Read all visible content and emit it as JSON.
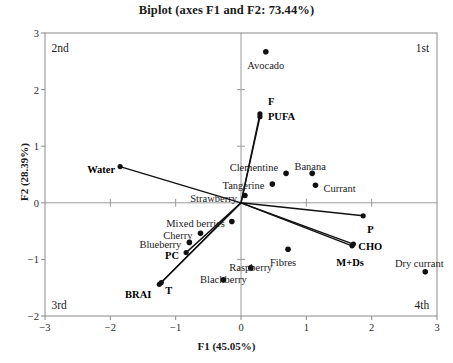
{
  "chart_data": {
    "type": "scatter",
    "title": "Biplot (axes F1 and F2: 73.44%)",
    "xlabel": "F1 (45.05%)",
    "ylabel": "F2 (28.39%)",
    "xlim": [
      -3,
      3
    ],
    "ylim": [
      -2,
      3
    ],
    "xticks": [
      "-3",
      "-2",
      "-1",
      "0",
      "1",
      "2",
      "3"
    ],
    "xtick_values": [
      -3,
      -2,
      -1,
      0,
      1,
      2,
      3
    ],
    "yticks": [
      "-2",
      "-1",
      "0",
      "1",
      "2",
      "3"
    ],
    "ytick_values": [
      -2,
      -1,
      0,
      1,
      2,
      3
    ],
    "grid": false,
    "legend": "none",
    "quadrant_labels": [
      {
        "text": "2nd",
        "x": -2.9,
        "y": 2.72,
        "anchor": "start"
      },
      {
        "text": "1st",
        "x": 2.88,
        "y": 2.72,
        "anchor": "end"
      },
      {
        "text": "3rd",
        "x": -2.9,
        "y": -1.83,
        "anchor": "start"
      },
      {
        "text": "4th",
        "x": 2.88,
        "y": -1.83,
        "anchor": "end"
      }
    ],
    "observations": [
      {
        "name": "Avocado",
        "x": 0.38,
        "y": 2.67,
        "label_dx": 0,
        "label_dy": 14,
        "anchor": "middle"
      },
      {
        "name": "Clementine",
        "x": 0.69,
        "y": 0.52,
        "label_dx": -8,
        "label_dy": -5,
        "anchor": "end"
      },
      {
        "name": "Tangerine",
        "x": 0.48,
        "y": 0.33,
        "label_dx": -8,
        "label_dy": 2,
        "anchor": "end"
      },
      {
        "name": "Strawberry",
        "x": 0.06,
        "y": 0.13,
        "label_dx": -8,
        "label_dy": 4,
        "anchor": "end"
      },
      {
        "name": "Mixed berries",
        "x": -0.14,
        "y": -0.33,
        "label_dx": -7,
        "label_dy": 3,
        "anchor": "end"
      },
      {
        "name": "Cherry",
        "x": -0.62,
        "y": -0.54,
        "label_dx": -8,
        "label_dy": 3,
        "anchor": "end"
      },
      {
        "name": "Blueberry",
        "x": -0.79,
        "y": -0.7,
        "label_dx": -8,
        "label_dy": 3,
        "anchor": "end"
      },
      {
        "name": "Banana",
        "x": 1.09,
        "y": 0.52,
        "label_dx": -2,
        "label_dy": -6,
        "anchor": "middle"
      },
      {
        "name": "Currant",
        "x": 1.14,
        "y": 0.31,
        "label_dx": 8,
        "label_dy": 4,
        "anchor": "start"
      },
      {
        "name": "Fibres",
        "x": 0.72,
        "y": -0.82,
        "label_dx": -5,
        "label_dy": 14,
        "anchor": "middle"
      },
      {
        "name": "Raspberry",
        "x": 0.15,
        "y": -1.15,
        "label_dx": 0,
        "label_dy": 0,
        "anchor": "middle"
      },
      {
        "name": "Blackberry",
        "x": -0.27,
        "y": -1.36,
        "label_dx": 0,
        "label_dy": 0,
        "anchor": "middle"
      },
      {
        "name": "Dry currant",
        "x": 2.82,
        "y": -1.22,
        "label_dx": -6,
        "label_dy": -8,
        "anchor": "middle"
      }
    ],
    "variable_vectors": [
      {
        "name": "F",
        "x": 0.29,
        "y": 1.57,
        "label_dx": 8,
        "label_dy": -11,
        "anchor": "start"
      },
      {
        "name": "PUFA",
        "x": 0.29,
        "y": 1.52,
        "label_dx": 8,
        "label_dy": 1,
        "anchor": "start"
      },
      {
        "name": "Water",
        "x": -1.85,
        "y": 0.64,
        "label_dx": -5,
        "label_dy": 4,
        "anchor": "end"
      },
      {
        "name": "P",
        "x": 1.87,
        "y": -0.23,
        "label_dx": 4,
        "label_dy": 15,
        "anchor": "start"
      },
      {
        "name": "CHO",
        "x": 1.72,
        "y": -0.73,
        "label_dx": 5,
        "label_dy": 4,
        "anchor": "start"
      },
      {
        "name": "M+Ds",
        "x": 1.7,
        "y": -0.76,
        "label_dx": -2,
        "label_dy": 18,
        "anchor": "middle"
      },
      {
        "name": "PC",
        "x": -0.84,
        "y": -0.88,
        "label_dx": -7,
        "label_dy": 4,
        "anchor": "end"
      },
      {
        "name": "BRAI",
        "x": -1.25,
        "y": -1.44,
        "label_dx": -8,
        "label_dy": 12,
        "anchor": "end"
      },
      {
        "name": "T",
        "x": -1.22,
        "y": -1.41,
        "label_dx": 4,
        "label_dy": 9,
        "anchor": "start"
      }
    ],
    "notes": {
      "observation_marker": "filled-circle",
      "vector_marker": "line-from-origin-with-dot",
      "origin": [
        0,
        0
      ]
    }
  }
}
